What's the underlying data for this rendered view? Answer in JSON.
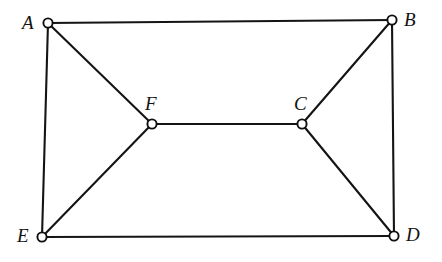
{
  "figure": {
    "type": "undirected-graph-diagram",
    "width": 442,
    "height": 262,
    "background_color": "#ffffff",
    "stroke_color": "#141414",
    "label_color": "#121212",
    "vertex_fill_color": "#ffffff",
    "vertex_radius": 4.6,
    "edge_width": 2.1
  },
  "vertices": [
    {
      "id": "A",
      "label": "A",
      "cx": 48,
      "cy": 23,
      "label_x": 22,
      "label_y": 13,
      "label_anchor": "left"
    },
    {
      "id": "B",
      "label": "B",
      "cx": 392,
      "cy": 20,
      "label_x": 404,
      "label_y": 10,
      "label_anchor": "right"
    },
    {
      "id": "C",
      "label": "C",
      "cx": 302,
      "cy": 124,
      "label_x": 294,
      "label_y": 94,
      "label_anchor": "above"
    },
    {
      "id": "D",
      "label": "D",
      "cx": 394,
      "cy": 236,
      "label_x": 406,
      "label_y": 225,
      "label_anchor": "right"
    },
    {
      "id": "E",
      "label": "E",
      "cx": 42,
      "cy": 237,
      "label_x": 17,
      "label_y": 226,
      "label_anchor": "left"
    },
    {
      "id": "F",
      "label": "F",
      "cx": 152,
      "cy": 124,
      "label_x": 145,
      "label_y": 94,
      "label_anchor": "above"
    }
  ],
  "edges": [
    {
      "id": "edge-a-b",
      "from": "A",
      "to": "B"
    },
    {
      "id": "edge-a-e",
      "from": "A",
      "to": "E"
    },
    {
      "id": "edge-a-f",
      "from": "A",
      "to": "F"
    },
    {
      "id": "edge-b-c",
      "from": "B",
      "to": "C"
    },
    {
      "id": "edge-b-d",
      "from": "B",
      "to": "D"
    },
    {
      "id": "edge-c-d",
      "from": "C",
      "to": "D"
    },
    {
      "id": "edge-c-f",
      "from": "C",
      "to": "F"
    },
    {
      "id": "edge-e-d",
      "from": "E",
      "to": "D"
    },
    {
      "id": "edge-e-f",
      "from": "E",
      "to": "F"
    }
  ]
}
